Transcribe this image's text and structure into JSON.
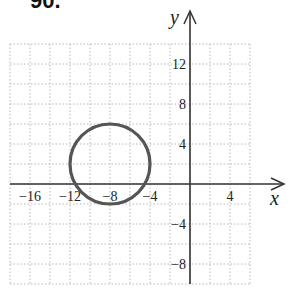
{
  "problem_number": "90.",
  "chart_data": {
    "type": "scatter",
    "title": "",
    "xlabel": "x",
    "ylabel": "y",
    "xlim": [
      -18,
      6
    ],
    "ylim": [
      -10,
      14
    ],
    "grid": true,
    "grid_step": 2,
    "x_ticks": [
      {
        "value": -16,
        "label": "−16"
      },
      {
        "value": -12,
        "label": "−12"
      },
      {
        "value": -8,
        "label": "−8"
      },
      {
        "value": -4,
        "label": "−4"
      },
      {
        "value": 4,
        "label": "4"
      }
    ],
    "y_ticks": [
      {
        "value": 12,
        "label": "12"
      },
      {
        "value": 8,
        "label": "8"
      },
      {
        "value": 4,
        "label": "4"
      },
      {
        "value": -4,
        "label": "−4"
      },
      {
        "value": -8,
        "label": "−8"
      }
    ],
    "shapes": [
      {
        "type": "circle",
        "center": [
          -8,
          2
        ],
        "radius": 4,
        "color": "#555555"
      }
    ]
  }
}
